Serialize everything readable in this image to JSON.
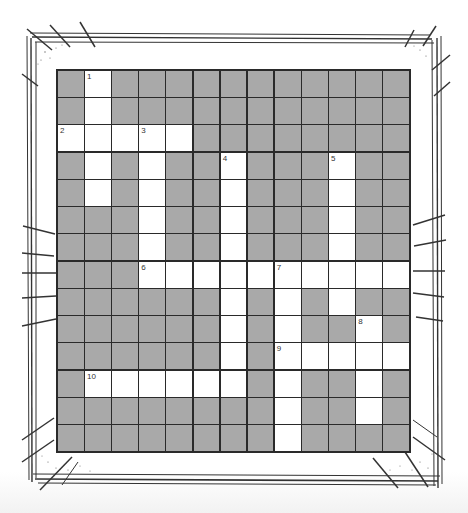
{
  "puzzle": {
    "rows": 14,
    "cols": 13,
    "colors": {
      "block": "#a9a9a9",
      "open": "#ffffff",
      "line": "#2a2a2a"
    },
    "layout": [
      ".W...........",
      ".W...........",
      "WWWWW........",
      ".W.W..W...W..",
      ".W.W..W...W..",
      "...W..W...W..",
      "...W..W...W..",
      "...WWWWWWWWWW",
      "......W.W.W..",
      "......W.W..W.",
      "......W.WWWWW",
      ".WWWWWW.W..W.",
      "........W..W.",
      "........W...."
    ],
    "numbers": [
      {
        "n": "1",
        "r": 0,
        "c": 1
      },
      {
        "n": "2",
        "r": 2,
        "c": 0
      },
      {
        "n": "3",
        "r": 2,
        "c": 3
      },
      {
        "n": "4",
        "r": 3,
        "c": 6
      },
      {
        "n": "5",
        "r": 3,
        "c": 10
      },
      {
        "n": "6",
        "r": 7,
        "c": 3
      },
      {
        "n": "7",
        "r": 7,
        "c": 8
      },
      {
        "n": "8",
        "r": 9,
        "c": 11
      },
      {
        "n": "9",
        "r": 10,
        "c": 8
      },
      {
        "n": "10",
        "r": 11,
        "c": 1
      }
    ]
  }
}
